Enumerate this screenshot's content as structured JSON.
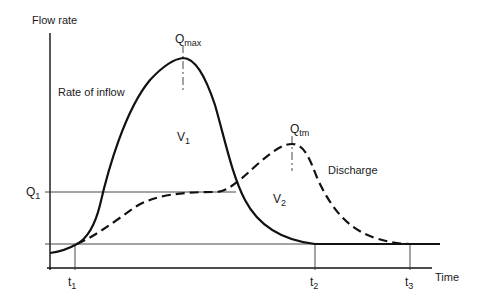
{
  "axes": {
    "y_label": "Flow rate",
    "x_label": "Time"
  },
  "curves": {
    "inflow_label": "Rate of inflow",
    "discharge_label": "Discharge"
  },
  "markers": {
    "qmax": {
      "main": "Q",
      "sub": "max"
    },
    "qtm": {
      "main": "Q",
      "sub": "tm"
    },
    "q1": {
      "main": "Q",
      "sub": "1"
    },
    "v1": {
      "main": "V",
      "sub": "1"
    },
    "v2": {
      "main": "V",
      "sub": "2"
    },
    "t1": {
      "main": "t",
      "sub": "1"
    },
    "t2": {
      "main": "t",
      "sub": "2"
    },
    "t3": {
      "main": "t",
      "sub": "3"
    }
  },
  "colors": {
    "line": "#111111",
    "background": "#ffffff"
  }
}
